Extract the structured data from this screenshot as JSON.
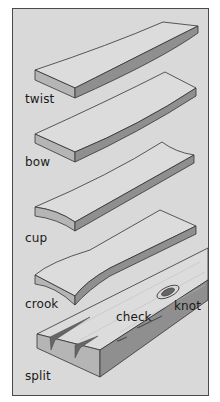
{
  "figure": {
    "background": "#d9d9d9",
    "border_color": "#4a4a4a",
    "board_top_color": "#dcdcdc",
    "board_side_color": "#8f8f8f",
    "board_end_color": "#b5b5b5",
    "defects": [
      {
        "label": "twist"
      },
      {
        "label": "bow"
      },
      {
        "label": "cup"
      },
      {
        "label": "crook"
      },
      {
        "label": "check"
      },
      {
        "label": "knot"
      },
      {
        "label": "split"
      }
    ]
  }
}
